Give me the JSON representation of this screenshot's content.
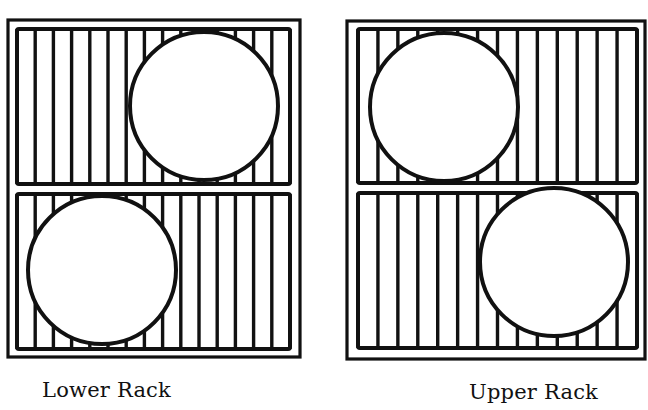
{
  "figure": {
    "type": "dishwasher-rack-loading-diagram",
    "ink_color": "#111111",
    "paper_color": "#ffffff"
  },
  "racks": [
    {
      "id": "lower",
      "label": "Lower Rack",
      "frame": {
        "x": 8,
        "y": 20,
        "w": 292,
        "h": 337
      },
      "panels": [
        {
          "position": "top",
          "rect": {
            "x": 17,
            "y": 29,
            "w": 273,
            "h": 155
          },
          "tine_spacing": 18.2,
          "item": {
            "shape": "circle",
            "name": "plate",
            "cx": 204,
            "cy": 106,
            "r": 74,
            "side": "right"
          }
        },
        {
          "position": "bottom",
          "rect": {
            "x": 17,
            "y": 194,
            "w": 273,
            "h": 155
          },
          "tine_spacing": 18.2,
          "item": {
            "shape": "circle",
            "name": "plate",
            "cx": 102,
            "cy": 270,
            "r": 74,
            "side": "left"
          }
        }
      ]
    },
    {
      "id": "upper",
      "label": "Upper Rack",
      "frame": {
        "x": 347,
        "y": 21,
        "w": 298,
        "h": 338
      },
      "panels": [
        {
          "position": "top",
          "rect": {
            "x": 358,
            "y": 29,
            "w": 279,
            "h": 154
          },
          "tine_spacing": 19.9,
          "item": {
            "shape": "circle",
            "name": "plate",
            "cx": 444,
            "cy": 107,
            "r": 74,
            "side": "left"
          }
        },
        {
          "position": "bottom",
          "rect": {
            "x": 358,
            "y": 193,
            "w": 279,
            "h": 155
          },
          "tine_spacing": 19.9,
          "item": {
            "shape": "circle",
            "name": "plate",
            "cx": 554,
            "cy": 262,
            "r": 74,
            "side": "right"
          }
        }
      ]
    }
  ]
}
